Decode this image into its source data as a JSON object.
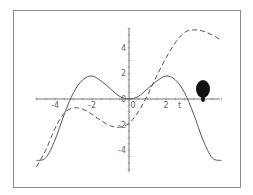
{
  "chart_data": {
    "type": "line",
    "title": "",
    "xlabel": "t",
    "ylabel": "",
    "xlim": [
      -5.2,
      5.5
    ],
    "ylim": [
      -5.5,
      5.6
    ],
    "x_ticks": [
      "-4",
      "-2",
      "0",
      "2"
    ],
    "y_ticks": [
      "4",
      "2",
      "0",
      "-2",
      "-4"
    ],
    "grid": false,
    "legend": null,
    "series": [
      {
        "name": "solid curve",
        "style": "solid",
        "x": [
          -5.0,
          -4.5,
          -4.0,
          -3.5,
          -3.0,
          -2.5,
          -2.0,
          -1.5,
          -1.0,
          -0.5,
          0.0,
          0.5,
          1.0,
          1.5,
          2.0,
          2.5,
          3.0,
          3.5,
          4.0,
          4.5,
          5.0
        ],
        "y": [
          -4.8,
          -4.6,
          -3.2,
          -1.2,
          0.5,
          1.5,
          1.8,
          1.4,
          0.8,
          0.2,
          0.0,
          0.2,
          0.8,
          1.4,
          1.8,
          1.5,
          0.5,
          -1.2,
          -3.2,
          -4.6,
          -4.8
        ]
      },
      {
        "name": "dashed curve",
        "style": "dashed",
        "x": [
          -5.0,
          -4.5,
          -4.0,
          -3.5,
          -3.0,
          -2.5,
          -2.0,
          -1.5,
          -1.0,
          -0.5,
          0.0,
          0.5,
          1.0,
          1.5,
          2.0,
          2.5,
          3.0,
          3.5,
          4.0,
          4.5,
          5.0
        ],
        "y": [
          -5.3,
          -4.0,
          -2.3,
          -1.1,
          -0.7,
          -0.8,
          -1.2,
          -1.7,
          -2.1,
          -2.2,
          -1.9,
          -1.0,
          0.3,
          1.8,
          3.2,
          4.4,
          5.2,
          5.4,
          5.3,
          5.0,
          4.6
        ]
      }
    ],
    "annotations": [
      "dark ink blot near x≈3.9, y≈0.3"
    ]
  },
  "axes": {
    "x_label": "t",
    "x_ticks": [
      {
        "label": "-4",
        "value": -4
      },
      {
        "label": "-2",
        "value": -2
      },
      {
        "label": "0",
        "value": 0
      },
      {
        "label": "2",
        "value": 2
      }
    ],
    "y_ticks": [
      {
        "label": "4",
        "value": 4
      },
      {
        "label": "2",
        "value": 2
      },
      {
        "label": "0",
        "value": 0
      },
      {
        "label": "-2",
        "value": -2
      },
      {
        "label": "-4",
        "value": -4
      }
    ]
  }
}
